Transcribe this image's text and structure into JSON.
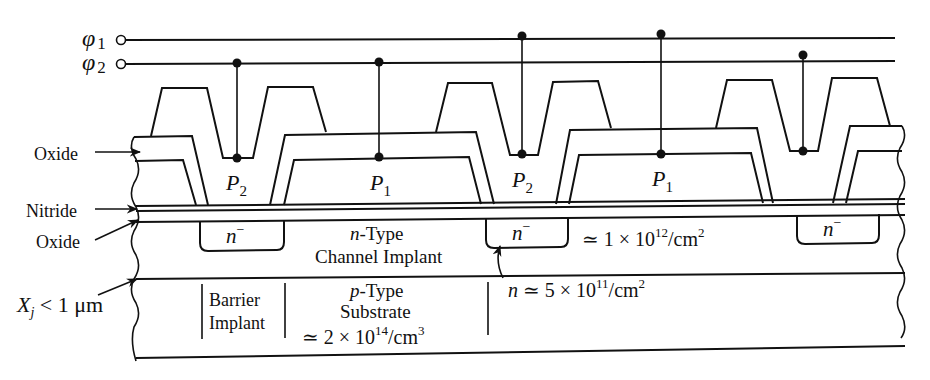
{
  "diagram": {
    "type": "cross-section",
    "clock_lines": [
      {
        "label": "φ",
        "subscript": "1",
        "y": 40
      },
      {
        "label": "φ",
        "subscript": "2",
        "y": 64
      }
    ],
    "electrodes": [
      {
        "label": "P",
        "subscript": "2",
        "x": 237
      },
      {
        "label": "P",
        "subscript": "1",
        "x": 379
      },
      {
        "label": "P",
        "subscript": "2",
        "x": 522
      },
      {
        "label": "P",
        "subscript": "1",
        "x": 661
      },
      {
        "label": "P",
        "subscript": "2",
        "x": 803
      }
    ],
    "left_labels": {
      "oxide_top": "Oxide",
      "nitride": "Nitride",
      "oxide_bottom": "Oxide",
      "junction_depth": {
        "symbol": "X",
        "subscript": "j",
        "rest": " < 1 μm"
      }
    },
    "regions": {
      "n_minus": {
        "base": "n",
        "sup": "−"
      },
      "channel_implant_line1_italic": "n",
      "channel_implant_line1_rest": "-Type",
      "channel_implant_line2": "Channel Implant",
      "channel_dose": {
        "prefix": "≃ 1 × 10",
        "exp": "12",
        "unit": "/cm",
        "unit_exp": "2"
      },
      "barrier_line1": "Barrier",
      "barrier_line2": "Implant",
      "substrate_line1_italic": "p",
      "substrate_line1_rest": "-Type",
      "substrate_line2": "Substrate",
      "substrate_conc": {
        "prefix": "≃ 2 × 10",
        "exp": "14",
        "unit": "/cm",
        "unit_exp": "3"
      },
      "barrier_dose": {
        "italic": "n",
        "prefix": " ≃ 5 × 10",
        "exp": "11",
        "unit": "/cm",
        "unit_exp": "2"
      }
    }
  }
}
